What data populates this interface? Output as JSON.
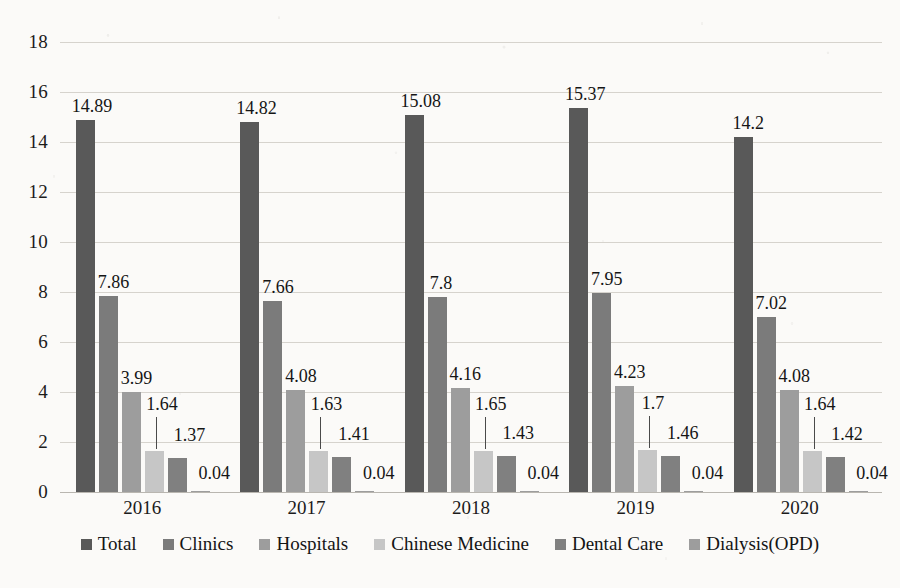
{
  "chart_data": {
    "type": "bar",
    "title": "",
    "subtitle": "",
    "xlabel": "",
    "ylabel": "",
    "ylim": [
      0,
      18
    ],
    "ytick_step": 2,
    "yticks": [
      "18",
      "16",
      "14",
      "12",
      "10",
      "8",
      "6",
      "4",
      "2",
      "0"
    ],
    "grid": true,
    "legend_position": "bottom",
    "categories": [
      "2016",
      "2017",
      "2018",
      "2019",
      "2020"
    ],
    "series": [
      {
        "name": "Total",
        "color": "#595959",
        "values": [
          14.89,
          14.82,
          15.08,
          15.37,
          14.2
        ],
        "labels": [
          "14.89",
          "14.82",
          "15.08",
          "15.37",
          "14.2"
        ]
      },
      {
        "name": "Clinics",
        "color": "#7b7b7b",
        "values": [
          7.86,
          7.66,
          7.8,
          7.95,
          7.02
        ],
        "labels": [
          "7.86",
          "7.66",
          "7.8",
          "7.95",
          "7.02"
        ]
      },
      {
        "name": "Hospitals",
        "color": "#9d9d9d",
        "values": [
          3.99,
          4.08,
          4.16,
          4.23,
          4.08
        ],
        "labels": [
          "3.99",
          "4.08",
          "4.16",
          "4.23",
          "4.08"
        ]
      },
      {
        "name": "Chinese Medicine",
        "color": "#c6c6c6",
        "values": [
          1.64,
          1.63,
          1.65,
          1.7,
          1.64
        ],
        "labels": [
          "1.64",
          "1.63",
          "1.65",
          "1.7",
          "1.64"
        ]
      },
      {
        "name": "Dental Care",
        "color": "#808080",
        "values": [
          1.37,
          1.41,
          1.43,
          1.46,
          1.42
        ],
        "labels": [
          "1.37",
          "1.41",
          "1.43",
          "1.46",
          "1.42"
        ]
      },
      {
        "name": "Dialysis(OPD)",
        "color": "#9d9d9d",
        "values": [
          0.04,
          0.04,
          0.04,
          0.04,
          0.04
        ],
        "labels": [
          "0.04",
          "0.04",
          "0.04",
          "0.04",
          "0.04"
        ]
      }
    ]
  }
}
